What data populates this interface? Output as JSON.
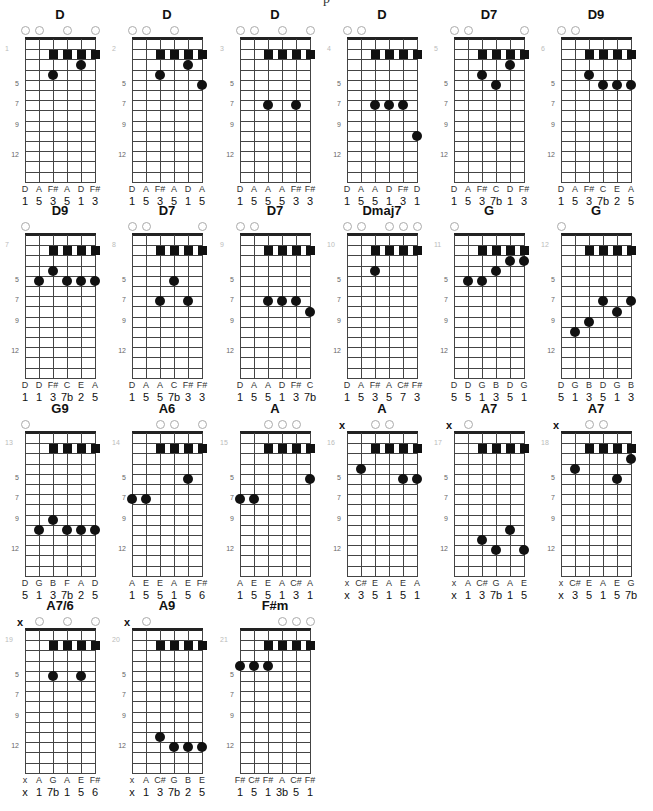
{
  "page": {
    "title": "p"
  },
  "layout": {
    "string_spacing": 14,
    "fret_height": 10.2,
    "num_frets": 14,
    "columns_x": [
      25,
      132,
      240,
      347,
      454,
      561
    ],
    "rows_nut_y": [
      39,
      235,
      433,
      630
    ],
    "fret_labels": [
      "5",
      "7",
      "9",
      "12"
    ],
    "fret_label_positions": [
      5,
      7,
      9,
      12
    ],
    "bar_fret": 2,
    "bar_strings": [
      3,
      4,
      5,
      6
    ]
  },
  "charts": [
    {
      "num": "1",
      "name": "D",
      "open": [
        1,
        2,
        4,
        6
      ],
      "muted": [],
      "dots": [
        [
          3,
          4
        ],
        [
          5,
          3
        ]
      ],
      "notes": [
        "D",
        "A",
        "F#",
        "A",
        "D",
        "F#"
      ],
      "intervals": [
        "1",
        "5",
        "3",
        "5",
        "1",
        "3"
      ]
    },
    {
      "num": "2",
      "name": "D",
      "open": [
        1,
        2,
        4
      ],
      "muted": [],
      "dots": [
        [
          3,
          4
        ],
        [
          5,
          3
        ],
        [
          6,
          5
        ]
      ],
      "notes": [
        "D",
        "A",
        "F#",
        "A",
        "D",
        "A"
      ],
      "intervals": [
        "1",
        "5",
        "3",
        "5",
        "1",
        "5"
      ]
    },
    {
      "num": "3",
      "name": "D",
      "open": [
        1,
        2,
        4,
        6
      ],
      "muted": [],
      "dots": [
        [
          3,
          7
        ],
        [
          5,
          7
        ]
      ],
      "notes": [
        "D",
        "A",
        "A",
        "A",
        "F#",
        "F#"
      ],
      "intervals": [
        "1",
        "5",
        "5",
        "5",
        "3",
        "3"
      ]
    },
    {
      "num": "4",
      "name": "D",
      "open": [
        1,
        2
      ],
      "muted": [],
      "dots": [
        [
          3,
          7
        ],
        [
          4,
          7
        ],
        [
          5,
          7
        ],
        [
          6,
          10
        ]
      ],
      "notes": [
        "D",
        "A",
        "A",
        "D",
        "F#",
        "D"
      ],
      "intervals": [
        "1",
        "5",
        "5",
        "1",
        "3",
        "1"
      ]
    },
    {
      "num": "5",
      "name": "D7",
      "open": [
        1,
        2,
        6
      ],
      "muted": [],
      "dots": [
        [
          3,
          4
        ],
        [
          4,
          5
        ],
        [
          5,
          3
        ]
      ],
      "notes": [
        "D",
        "A",
        "F#",
        "C",
        "D",
        "F#"
      ],
      "intervals": [
        "1",
        "5",
        "3",
        "7b",
        "1",
        "3"
      ]
    },
    {
      "num": "6",
      "name": "D9",
      "open": [
        1,
        2
      ],
      "muted": [],
      "dots": [
        [
          3,
          4
        ],
        [
          4,
          5
        ],
        [
          5,
          5
        ],
        [
          6,
          5
        ]
      ],
      "notes": [
        "D",
        "A",
        "F#",
        "C",
        "E",
        "A"
      ],
      "intervals": [
        "1",
        "5",
        "3",
        "7b",
        "2",
        "5"
      ]
    },
    {
      "num": "7",
      "name": "D9",
      "open": [
        1
      ],
      "muted": [],
      "dots": [
        [
          2,
          5
        ],
        [
          3,
          4
        ],
        [
          4,
          5
        ],
        [
          5,
          5
        ],
        [
          6,
          5
        ]
      ],
      "notes": [
        "D",
        "D",
        "F#",
        "C",
        "E",
        "A"
      ],
      "intervals": [
        "1",
        "1",
        "3",
        "7b",
        "2",
        "5"
      ]
    },
    {
      "num": "8",
      "name": "D7",
      "open": [
        1,
        2,
        6
      ],
      "muted": [],
      "dots": [
        [
          3,
          7
        ],
        [
          4,
          5
        ],
        [
          5,
          7
        ]
      ],
      "notes": [
        "D",
        "A",
        "A",
        "C",
        "F#",
        "F#"
      ],
      "intervals": [
        "1",
        "5",
        "5",
        "7b",
        "3",
        "3"
      ]
    },
    {
      "num": "9",
      "name": "D7",
      "open": [
        1,
        2
      ],
      "muted": [],
      "dots": [
        [
          3,
          7
        ],
        [
          4,
          7
        ],
        [
          5,
          7
        ],
        [
          6,
          8
        ]
      ],
      "notes": [
        "D",
        "A",
        "A",
        "D",
        "F#",
        "C"
      ],
      "intervals": [
        "1",
        "5",
        "5",
        "1",
        "3",
        "7b"
      ]
    },
    {
      "num": "10",
      "name": "Dmaj7",
      "open": [
        1,
        2,
        4,
        5,
        6
      ],
      "muted": [],
      "dots": [
        [
          3,
          4
        ]
      ],
      "notes": [
        "D",
        "A",
        "F#",
        "A",
        "C#",
        "F#"
      ],
      "intervals": [
        "1",
        "5",
        "3",
        "5",
        "7",
        "3"
      ]
    },
    {
      "num": "11",
      "name": "G",
      "open": [
        1
      ],
      "muted": [],
      "dots": [
        [
          2,
          5
        ],
        [
          3,
          5
        ],
        [
          4,
          4
        ],
        [
          5,
          3
        ],
        [
          6,
          3
        ]
      ],
      "notes": [
        "D",
        "D",
        "G",
        "B",
        "D",
        "G"
      ],
      "intervals": [
        "5",
        "5",
        "1",
        "3",
        "5",
        "1"
      ]
    },
    {
      "num": "12",
      "name": "G",
      "open": [
        1
      ],
      "muted": [],
      "dots": [
        [
          2,
          10
        ],
        [
          3,
          9
        ],
        [
          4,
          7
        ],
        [
          5,
          8
        ],
        [
          6,
          7
        ]
      ],
      "notes": [
        "D",
        "G",
        "B",
        "D",
        "G",
        "B"
      ],
      "intervals": [
        "5",
        "1",
        "3",
        "5",
        "1",
        "3"
      ]
    },
    {
      "num": "13",
      "name": "G9",
      "open": [
        1
      ],
      "muted": [],
      "dots": [
        [
          2,
          10
        ],
        [
          3,
          9
        ],
        [
          4,
          10
        ],
        [
          5,
          10
        ],
        [
          6,
          10
        ]
      ],
      "notes": [
        "D",
        "G",
        "B",
        "F",
        "A",
        "D"
      ],
      "intervals": [
        "5",
        "1",
        "3",
        "7b",
        "2",
        "5"
      ]
    },
    {
      "num": "14",
      "name": "A6",
      "open": [
        3,
        4,
        6
      ],
      "muted": [],
      "dots": [
        [
          1,
          7
        ],
        [
          2,
          7
        ],
        [
          5,
          5
        ]
      ],
      "notes": [
        "A",
        "E",
        "E",
        "A",
        "E",
        "F#"
      ],
      "intervals": [
        "1",
        "5",
        "5",
        "1",
        "5",
        "6"
      ]
    },
    {
      "num": "15",
      "name": "A",
      "open": [
        3,
        4,
        5
      ],
      "muted": [],
      "dots": [
        [
          1,
          7
        ],
        [
          2,
          7
        ],
        [
          6,
          5
        ]
      ],
      "notes": [
        "A",
        "E",
        "E",
        "A",
        "C#",
        "A"
      ],
      "intervals": [
        "1",
        "5",
        "5",
        "1",
        "3",
        "1"
      ]
    },
    {
      "num": "16",
      "name": "A",
      "open": [
        3,
        4
      ],
      "muted": [
        1
      ],
      "dots": [
        [
          2,
          4
        ],
        [
          5,
          5
        ],
        [
          6,
          5
        ]
      ],
      "notes": [
        "x",
        "C#",
        "E",
        "A",
        "E",
        "A"
      ],
      "intervals": [
        "x",
        "3",
        "5",
        "1",
        "5",
        "1"
      ]
    },
    {
      "num": "17",
      "name": "A7",
      "open": [
        2
      ],
      "muted": [
        1
      ],
      "dots": [
        [
          3,
          11
        ],
        [
          4,
          12
        ],
        [
          5,
          10
        ],
        [
          6,
          12
        ]
      ],
      "notes": [
        "x",
        "A",
        "C#",
        "G",
        "A",
        "E"
      ],
      "intervals": [
        "x",
        "1",
        "3",
        "7b",
        "1",
        "5"
      ]
    },
    {
      "num": "18",
      "name": "A7",
      "open": [
        3,
        4
      ],
      "muted": [
        1
      ],
      "dots": [
        [
          2,
          4
        ],
        [
          5,
          5
        ],
        [
          6,
          3
        ]
      ],
      "notes": [
        "x",
        "C#",
        "E",
        "A",
        "E",
        "G"
      ],
      "intervals": [
        "x",
        "3",
        "5",
        "1",
        "5",
        "7b"
      ]
    },
    {
      "num": "19",
      "name": "A7/6",
      "open": [
        2,
        4,
        6
      ],
      "muted": [
        1
      ],
      "dots": [
        [
          3,
          5
        ],
        [
          5,
          5
        ]
      ],
      "notes": [
        "x",
        "A",
        "G",
        "A",
        "E",
        "F#"
      ],
      "intervals": [
        "x",
        "1",
        "7b",
        "1",
        "5",
        "6"
      ]
    },
    {
      "num": "20",
      "name": "A9",
      "open": [
        2
      ],
      "muted": [
        1
      ],
      "dots": [
        [
          3,
          11
        ],
        [
          4,
          12
        ],
        [
          5,
          12
        ],
        [
          6,
          12
        ]
      ],
      "notes": [
        "x",
        "A",
        "C#",
        "G",
        "B",
        "E"
      ],
      "intervals": [
        "x",
        "1",
        "3",
        "7b",
        "2",
        "5"
      ]
    },
    {
      "num": "21",
      "name": "F#m",
      "open": [
        4,
        5,
        6
      ],
      "muted": [],
      "dots": [
        [
          1,
          4
        ],
        [
          2,
          4
        ],
        [
          3,
          4
        ]
      ],
      "notes": [
        "F#",
        "C#",
        "F#",
        "A",
        "C#",
        "F#"
      ],
      "intervals": [
        "1",
        "5",
        "1",
        "3b",
        "5",
        "1"
      ]
    }
  ],
  "icons": {
    "open_string": "open-string-circle",
    "muted_string": "x",
    "barre_marker": "square",
    "finger_dot": "circle"
  },
  "colors": {
    "ink": "#111111",
    "grid": "#444444",
    "open_circle": "#aaaaaa",
    "chart_number": "#bbbbbb"
  }
}
